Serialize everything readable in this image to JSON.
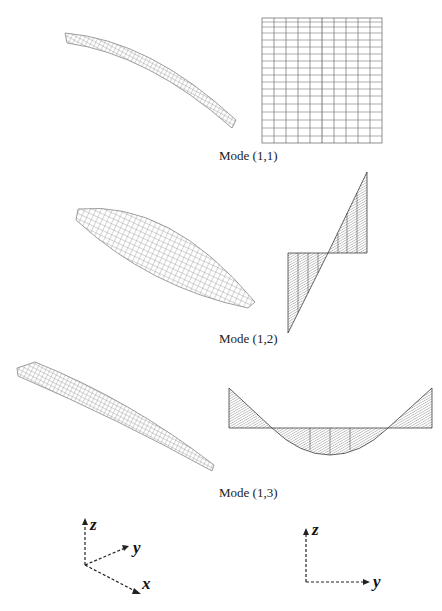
{
  "figure": {
    "modes": [
      {
        "id": "mode-1-1",
        "caption": "Mode (1,1)",
        "view_3d": "isometric single-curvature bent plate mesh",
        "view_2d": "rectangular mesh grid (y-z side view)"
      },
      {
        "id": "mode-1-2",
        "caption": "Mode (1,2)",
        "view_3d": "isometric lens-shaped twisted plate mesh",
        "view_2d": "antisymmetric two-triangle mode shape"
      },
      {
        "id": "mode-1-3",
        "caption": "Mode (1,3)",
        "view_3d": "isometric elongated plate mesh",
        "view_2d": "symmetric three-lobe mode shape"
      }
    ],
    "axes_3d": {
      "labels": [
        "z",
        "y",
        "x"
      ]
    },
    "axes_2d": {
      "labels": [
        "z",
        "y"
      ]
    },
    "colors": {
      "mesh_light": "#9a9a9a",
      "mesh_dark": "#222222",
      "text": "#222222"
    }
  }
}
